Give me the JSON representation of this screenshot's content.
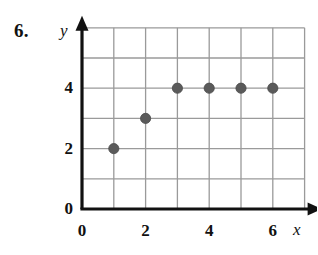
{
  "problem": {
    "number": "6."
  },
  "axes": {
    "x_name": "x",
    "y_name": "y",
    "x_tick_labels": [
      "0",
      "2",
      "4",
      "6"
    ],
    "y_tick_labels": [
      "0",
      "2",
      "4"
    ],
    "origin_label": "0"
  },
  "colors": {
    "axis": "#111111",
    "grid": "#9a9a9a",
    "point": "#5a5a5a",
    "point_stroke": "#4a4a4a",
    "background": "#ffffff",
    "text": "#111111"
  },
  "chart_data": {
    "type": "scatter",
    "title": "",
    "xlabel": "x",
    "ylabel": "y",
    "x": [
      1,
      2,
      3,
      4,
      5,
      6
    ],
    "y": [
      2,
      3,
      4,
      4,
      4,
      4
    ],
    "points": [
      {
        "x": 1,
        "y": 2
      },
      {
        "x": 2,
        "y": 3
      },
      {
        "x": 3,
        "y": 4
      },
      {
        "x": 4,
        "y": 4
      },
      {
        "x": 5,
        "y": 4
      },
      {
        "x": 6,
        "y": 4
      }
    ],
    "xlim": [
      0,
      7
    ],
    "ylim": [
      0,
      6
    ],
    "xticks": [
      0,
      2,
      4,
      6
    ],
    "yticks": [
      0,
      2,
      4
    ],
    "grid": true,
    "grid_x_lines": [
      0,
      1,
      2,
      3,
      4,
      5,
      6,
      7
    ],
    "grid_y_lines": [
      0,
      1,
      2,
      3,
      4,
      5,
      6
    ],
    "legend": null,
    "marker": "circle",
    "marker_color": "#5a5a5a"
  }
}
